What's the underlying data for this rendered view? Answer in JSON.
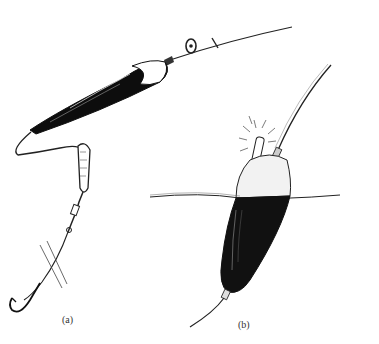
{
  "figure": {
    "panels": [
      {
        "id": "a",
        "label": "(a)",
        "description": "Slider float rig with stop knot, bead, float, weight, swivel and hook"
      },
      {
        "id": "b",
        "label": "(b)",
        "description": "Float at water surface with illuminated night-light tip"
      }
    ],
    "colors": {
      "ink": "#111111",
      "background": "#ffffff"
    }
  }
}
